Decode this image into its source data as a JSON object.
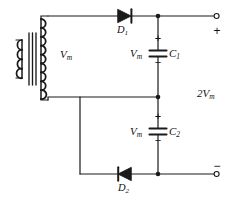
{
  "diagram": {
    "colors": {
      "wire": "#1a1a1a",
      "text": "#111111",
      "background": "#ffffff"
    },
    "transformer": {
      "name": "transformer",
      "secondary_voltage_label": "V",
      "secondary_voltage_sub": "m"
    },
    "diodes": [
      {
        "id": "D1",
        "label": "D",
        "sub": "1",
        "orientation": "right"
      },
      {
        "id": "D2",
        "label": "D",
        "sub": "2",
        "orientation": "left"
      }
    ],
    "capacitors": [
      {
        "id": "C1",
        "label": "C",
        "sub": "1",
        "voltage_label": "V",
        "voltage_sub": "m",
        "plus": "+",
        "minus": "−"
      },
      {
        "id": "C2",
        "label": "C",
        "sub": "2",
        "voltage_label": "V",
        "voltage_sub": "m",
        "plus": "+",
        "minus": "−"
      }
    ],
    "output": {
      "voltage_label": "2V",
      "voltage_sub": "m",
      "positive_terminal": "+",
      "negative_terminal": "−"
    }
  }
}
